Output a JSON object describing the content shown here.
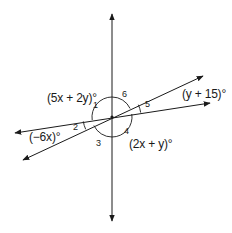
{
  "diagram": {
    "type": "intersecting-lines-angles",
    "center": [
      112,
      117
    ],
    "lines": [
      {
        "name": "vertical-line",
        "from": [
          112,
          14
        ],
        "to": [
          112,
          221
        ],
        "arrows": "both"
      },
      {
        "name": "steep-diagonal-line",
        "from": [
          23,
          160
        ],
        "to": [
          203,
          76
        ],
        "arrows": "both"
      },
      {
        "name": "shallow-diagonal-line",
        "from": [
          15,
          133
        ],
        "to": [
          210,
          103
        ],
        "arrows": "both"
      }
    ],
    "expressions": {
      "angle1": "(5x + 2y)°",
      "angle5": "(y + 15)°",
      "angle2": "(−6x)°",
      "angle4": "(2x + y)°"
    },
    "angle_numbers": {
      "a1": "1",
      "a2": "2",
      "a3": "3",
      "a4": "4",
      "a5": "5",
      "a6": "6"
    },
    "colors": {
      "stroke": "#1a1a1a",
      "background": "#ffffff"
    }
  }
}
